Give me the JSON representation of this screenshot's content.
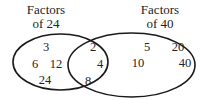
{
  "diagram": {
    "type": "venn",
    "sets": [
      {
        "id": "A",
        "label_line1": "Factors",
        "label_line2": "of 24",
        "only_elements": [
          "3",
          "6",
          "12",
          "24"
        ]
      },
      {
        "id": "B",
        "label_line1": "Factors",
        "label_line2": "of 40",
        "only_elements": [
          "5",
          "20",
          "10",
          "40"
        ]
      }
    ],
    "intersection": [
      "2",
      "4",
      "8"
    ],
    "stroke_color": "#1a1a1a",
    "text_color": "#222222"
  }
}
